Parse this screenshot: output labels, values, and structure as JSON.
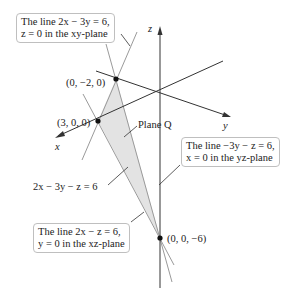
{
  "diagram": {
    "type": "3d-plane-traces",
    "plane_label": "Plane Q",
    "plane_equation": "2x − 3y − z = 6",
    "axes": {
      "x": "x",
      "y": "y",
      "z": "z"
    },
    "points": [
      {
        "label": "(0, −2, 0)"
      },
      {
        "label": "(3, 0, 0)"
      },
      {
        "label": "(0, 0, −6)"
      }
    ],
    "callouts": [
      {
        "line1": "The line 2x − 3y = 6,",
        "line2": "z = 0 in the xy-plane"
      },
      {
        "line1": "The line −3y − z = 6,",
        "line2": "x = 0 in the yz-plane"
      },
      {
        "line1": "The line 2x − z = 6,",
        "line2": "y = 0 in the xz-plane"
      }
    ],
    "colors": {
      "plane_fill": "#e3e3e3",
      "trace_line": "#9a9a9a",
      "axis": "#333333",
      "callout_border": "#bfbfbf"
    }
  }
}
